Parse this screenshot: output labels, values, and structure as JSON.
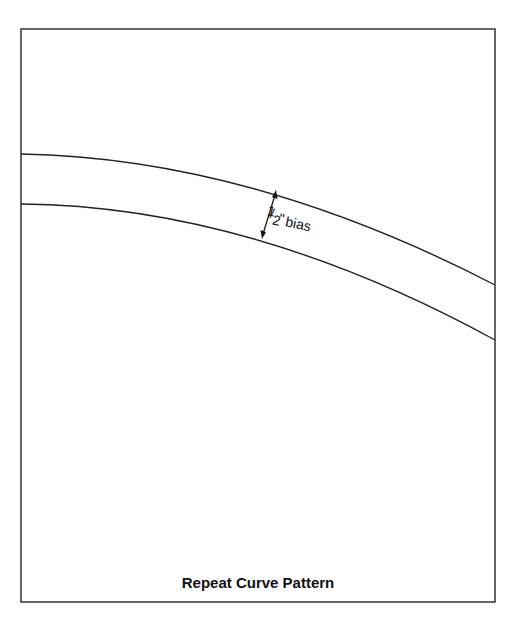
{
  "diagram": {
    "title": "Repeat Curve Pattern",
    "annotation": {
      "fraction_numerator": "1",
      "fraction_denominator": "2",
      "unit": "\"",
      "text": "bias"
    },
    "colors": {
      "line": "#222222",
      "frame": "#333333",
      "background": "#ffffff"
    }
  }
}
